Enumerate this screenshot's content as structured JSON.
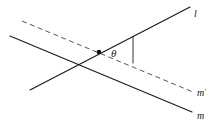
{
  "figure": {
    "background_color": "#ffffff",
    "stroke_color": "#1a1a1a",
    "width": 219,
    "height": 127,
    "labels": {
      "line_l": "l",
      "line_m": "m",
      "line_m_prime": "m",
      "line_m_prime_suffix": "′",
      "angle": "θ"
    },
    "elements": [
      {
        "name": "line-l",
        "label": "l",
        "style": "solid",
        "x1": 30,
        "y1": 90,
        "x2": 190,
        "y2": 7
      },
      {
        "name": "line-m",
        "label": "m",
        "style": "solid",
        "x1": 10,
        "y1": 36,
        "x2": 192,
        "y2": 112
      },
      {
        "name": "line-m-prime",
        "label": "m′",
        "style": "dashed",
        "x1": 22,
        "y1": 21,
        "x2": 193,
        "y2": 92
      },
      {
        "name": "angle-tick",
        "label": "",
        "style": "solid",
        "x1": 133,
        "y1": 37,
        "x2": 133,
        "y2": 63
      },
      {
        "name": "vertex-point",
        "label": "",
        "style": "dot",
        "x1": 99,
        "y1": 52,
        "x2": 99,
        "y2": 52
      }
    ],
    "label_positions": {
      "l": {
        "x": 194,
        "y": 17
      },
      "m": {
        "x": 197,
        "y": 119
      },
      "mp": {
        "x": 197,
        "y": 96
      },
      "theta": {
        "x": 111,
        "y": 57
      }
    }
  }
}
